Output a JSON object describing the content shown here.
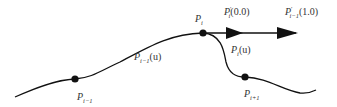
{
  "diagram": {
    "title": "",
    "stroke_color": "#111111",
    "label_color": "#333333",
    "points": [
      {
        "id": "P_i-1",
        "base": "P",
        "sub": "i−1",
        "x": 75,
        "y": 79
      },
      {
        "id": "P_i",
        "base": "P",
        "sub": "i",
        "x": 203,
        "y": 33
      },
      {
        "id": "P_i+1",
        "base": "P",
        "sub": "i+1",
        "x": 245,
        "y": 77
      }
    ],
    "curves": [
      {
        "id": "P_i-1(u)",
        "base": "P",
        "sub": "i−1",
        "arg": "(u)"
      },
      {
        "id": "P_i(u)",
        "base": "P",
        "sub": "i",
        "arg": "(u)"
      }
    ],
    "tangents": [
      {
        "id": "P'_i(0.0)",
        "base": "P",
        "sup": "′",
        "sub": "i",
        "arg": "(0.0)"
      },
      {
        "id": "P'_i-1(1.0)",
        "base": "P",
        "sup": "′",
        "sub": "i−1",
        "arg": "(1.0)"
      }
    ]
  }
}
